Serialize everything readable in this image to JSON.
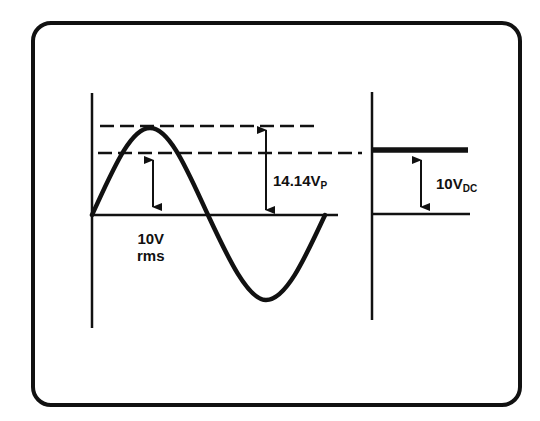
{
  "diagram": {
    "type": "ac-vs-dc-equivalence",
    "ac_panel": {
      "waveform": "sine",
      "peak_label": "14.14V",
      "peak_label_sub": "P",
      "rms_label_line1": "10V",
      "rms_label_line2": "rms"
    },
    "dc_panel": {
      "dc_label": "10V",
      "dc_label_sub": "DC"
    },
    "colors": {
      "ink": "#111111",
      "background": "#ffffff"
    }
  }
}
